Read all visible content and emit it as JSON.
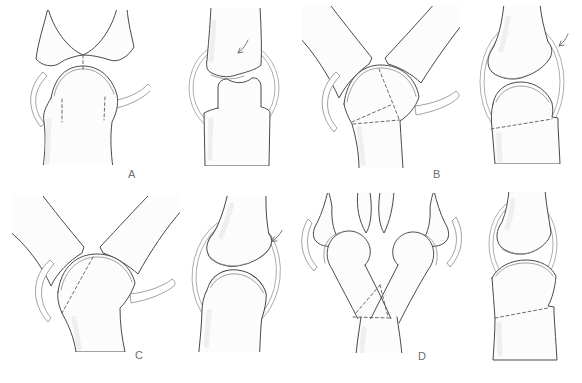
{
  "figure": {
    "background_color": "#ffffff",
    "line_color": "#4a4a4a",
    "secondary_line_color": "#8a8a8a",
    "dashed_fracture_line_color": "#5a5a5a",
    "label_color": "#6e6e6e",
    "panels": [
      {
        "id": "a",
        "label": "A",
        "views": [
          {
            "name": "frontal-view"
          },
          {
            "name": "lateral-view"
          }
        ]
      },
      {
        "id": "b",
        "label": "B",
        "views": [
          {
            "name": "frontal-view"
          },
          {
            "name": "lateral-view"
          }
        ]
      },
      {
        "id": "c",
        "label": "C",
        "views": [
          {
            "name": "frontal-view"
          },
          {
            "name": "lateral-view"
          }
        ]
      },
      {
        "id": "d",
        "label": "D",
        "views": [
          {
            "name": "frontal-view"
          },
          {
            "name": "lateral-view"
          }
        ]
      }
    ]
  }
}
